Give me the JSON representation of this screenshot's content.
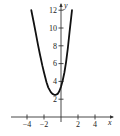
{
  "chart_data": {
    "type": "line",
    "title": "",
    "xlabel": "x",
    "ylabel": "y",
    "xlim": [
      -5.8,
      6.0
    ],
    "ylim": [
      0,
      12.8
    ],
    "x_ticks": [
      -4,
      -2,
      2,
      4
    ],
    "y_ticks": [
      2,
      4,
      6,
      8,
      10,
      12
    ],
    "grid": false,
    "series": [
      {
        "name": "curve",
        "color": "#111111",
        "x": [
          -3.5,
          -3.2,
          -3.0,
          -2.7,
          -2.5,
          -2.2,
          -2.0,
          -1.7,
          -1.5,
          -1.2,
          -1.0,
          -0.8,
          -0.6,
          -0.4,
          -0.2,
          0.0,
          0.2,
          0.4,
          0.6,
          0.8,
          1.0,
          1.15,
          1.3
        ],
        "y": [
          12.0,
          10.6,
          9.6,
          8.1,
          7.1,
          5.8,
          5.0,
          3.9,
          3.3,
          2.8,
          2.6,
          2.5,
          2.5,
          2.6,
          2.9,
          3.4,
          4.1,
          5.0,
          6.2,
          7.7,
          9.5,
          10.8,
          12.0
        ]
      }
    ]
  },
  "axes": {
    "x_tick_labels": [
      "−4",
      "−2",
      "2",
      "4"
    ],
    "y_tick_labels": [
      "2",
      "4",
      "6",
      "8",
      "10",
      "12"
    ],
    "x_axis_label": "x",
    "y_axis_label": "y"
  }
}
